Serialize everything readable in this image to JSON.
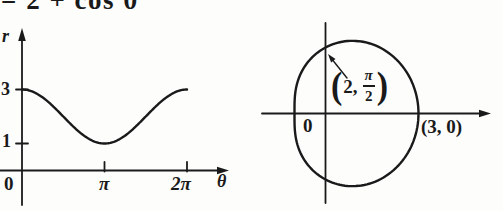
{
  "figure": {
    "equation_top": "= 2 + cos θ",
    "ink_color": "#1a1a1a",
    "background_color": "#fdfdfc"
  },
  "left_plot": {
    "y_axis_label": "r",
    "x_axis_label": "θ",
    "origin_label": "0",
    "x_tick_pi": "π",
    "x_tick_2pi": "2π",
    "y_tick_3": "3",
    "y_tick_1": "1"
  },
  "right_plot": {
    "origin_label": "0",
    "x_intercept_label": "(3, 0)",
    "point_label": {
      "open": "(",
      "lead": "2,",
      "num": "π",
      "den": "2",
      "close": ")"
    }
  },
  "chart_data": [
    {
      "type": "line",
      "title": "Cartesian graph of r = 2 + cos θ",
      "equation": "r = 2 + cos(θ)",
      "params": {
        "a": 2,
        "b": 1
      },
      "xlabel": "θ",
      "ylabel": "r",
      "x_domain_labels": [
        "0",
        "2π"
      ],
      "x_tick_labels": [
        "0",
        "π",
        "2π"
      ],
      "y_tick_labels": [
        1,
        3
      ],
      "ylim": [
        0,
        3.6
      ],
      "grid": false,
      "x": [
        "0",
        "π/4",
        "π/2",
        "3π/4",
        "π",
        "5π/4",
        "3π/2",
        "7π/4",
        "2π"
      ],
      "values": [
        3,
        2.71,
        2,
        1.29,
        1,
        1.29,
        2,
        2.71,
        3
      ]
    },
    {
      "type": "line",
      "subtype": "polar",
      "title": "Polar curve r = 2 + cos θ (convex limaçon)",
      "equation": "r = 2 + cos(θ)",
      "params": {
        "a": 2,
        "b": 1
      },
      "origin_label": "0",
      "key_points_polar": [
        [
          3,
          "0"
        ],
        [
          2,
          "π/2"
        ],
        [
          1,
          "π"
        ],
        [
          2,
          "3π/2"
        ],
        [
          3,
          "2π"
        ]
      ],
      "annotations": [
        {
          "text": "(2, π/2)",
          "polar_point": [
            "2",
            "π/2"
          ],
          "cartesian": [
            0,
            2
          ],
          "marker": "arrow-to-curve"
        },
        {
          "text": "(3, 0)",
          "polar_point": [
            "3",
            "0"
          ],
          "cartesian": [
            3,
            0
          ],
          "marker": "none"
        }
      ]
    }
  ]
}
